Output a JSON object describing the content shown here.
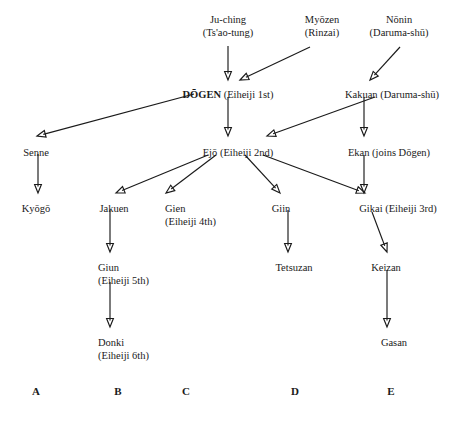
{
  "diagram": {
    "type": "lineage-tree",
    "title": "",
    "nodes": [
      {
        "id": "juching",
        "name": "Ju-ching",
        "detail": "(Ts'ao-tung)",
        "bold": false,
        "x": 228,
        "y": 14,
        "align": "center"
      },
      {
        "id": "myozen",
        "name": "Myōzen",
        "detail": "(Rinzai)",
        "bold": false,
        "x": 322,
        "y": 14,
        "align": "center"
      },
      {
        "id": "nonin",
        "name": "Nōnin",
        "detail": "(Daruma-shū)",
        "bold": false,
        "x": 399,
        "y": 14,
        "align": "center"
      },
      {
        "id": "dogen",
        "name": "DŌGEN",
        "detail": " (Eiheiji 1st)",
        "bold": true,
        "x": 228,
        "y": 89,
        "align": "center",
        "inline": true
      },
      {
        "id": "kakuan",
        "name": "Kakuan",
        "detail": " (Daruma-shū)",
        "bold": false,
        "x": 392,
        "y": 89,
        "align": "center",
        "inline": true
      },
      {
        "id": "senne",
        "name": "Senne",
        "detail": "",
        "bold": false,
        "x": 36,
        "y": 147,
        "align": "center"
      },
      {
        "id": "ejo",
        "name": "Ejō",
        "detail": " (Eiheiji 2nd)",
        "bold": false,
        "x": 238,
        "y": 147,
        "align": "center",
        "inline": true
      },
      {
        "id": "ekan",
        "name": "Ekan",
        "detail": " (joins Dōgen)",
        "bold": false,
        "x": 389,
        "y": 147,
        "align": "center",
        "inline": true
      },
      {
        "id": "kyogo",
        "name": "Kyōgō",
        "detail": "",
        "bold": false,
        "x": 36,
        "y": 203,
        "align": "center"
      },
      {
        "id": "jakuen",
        "name": "Jakuen",
        "detail": "",
        "bold": false,
        "x": 114,
        "y": 203,
        "align": "center"
      },
      {
        "id": "gien",
        "name": "Gien",
        "detail": "(Eiheiji 4th)",
        "bold": false,
        "x": 165,
        "y": 203,
        "align": "left"
      },
      {
        "id": "giin",
        "name": "Giin",
        "detail": "",
        "bold": false,
        "x": 281,
        "y": 203,
        "align": "center"
      },
      {
        "id": "gikai",
        "name": "Gikai",
        "detail": " (Eiheiji 3rd)",
        "bold": false,
        "x": 398,
        "y": 203,
        "align": "center",
        "inline": true
      },
      {
        "id": "giun",
        "name": "Giun",
        "detail": "(Eiheiji 5th)",
        "bold": false,
        "x": 98,
        "y": 262,
        "align": "left"
      },
      {
        "id": "tetsuzan",
        "name": "Tetsuzan",
        "detail": "",
        "bold": false,
        "x": 294,
        "y": 262,
        "align": "center"
      },
      {
        "id": "keizan",
        "name": "Keizan",
        "detail": "",
        "bold": false,
        "x": 386,
        "y": 262,
        "align": "center"
      },
      {
        "id": "donki",
        "name": "Donki",
        "detail": "(Eiheiji 6th)",
        "bold": false,
        "x": 98,
        "y": 337,
        "align": "left"
      },
      {
        "id": "gasan",
        "name": "Gasan",
        "detail": "",
        "bold": false,
        "x": 394,
        "y": 337,
        "align": "center"
      }
    ],
    "edges": [
      {
        "from": "juching",
        "to": "dogen",
        "x1": 228,
        "y1": 46,
        "x2": 228,
        "y2": 80
      },
      {
        "from": "myozen",
        "to": "dogen",
        "x1": 310,
        "y1": 47,
        "x2": 240,
        "y2": 80
      },
      {
        "from": "nonin",
        "to": "kakuan",
        "x1": 400,
        "y1": 47,
        "x2": 370,
        "y2": 80
      },
      {
        "from": "dogen",
        "to": "senne",
        "x1": 194,
        "y1": 94,
        "x2": 37,
        "y2": 136
      },
      {
        "from": "dogen",
        "to": "ejo",
        "x1": 228,
        "y1": 97,
        "x2": 228,
        "y2": 136
      },
      {
        "from": "kakuan",
        "to": "ejo",
        "x1": 375,
        "y1": 97,
        "x2": 267,
        "y2": 136
      },
      {
        "from": "kakuan",
        "to": "ekan",
        "x1": 364,
        "y1": 97,
        "x2": 364,
        "y2": 136
      },
      {
        "from": "senne",
        "to": "kyogo",
        "x1": 38,
        "y1": 154,
        "x2": 38,
        "y2": 193
      },
      {
        "from": "ejo",
        "to": "jakuen",
        "x1": 208,
        "y1": 155,
        "x2": 116,
        "y2": 193
      },
      {
        "from": "ejo",
        "to": "gien",
        "x1": 216,
        "y1": 155,
        "x2": 166,
        "y2": 193
      },
      {
        "from": "ejo",
        "to": "giin",
        "x1": 245,
        "y1": 155,
        "x2": 280,
        "y2": 193
      },
      {
        "from": "ejo",
        "to": "gikai",
        "x1": 263,
        "y1": 155,
        "x2": 365,
        "y2": 193
      },
      {
        "from": "ekan",
        "to": "gikai",
        "x1": 364,
        "y1": 155,
        "x2": 364,
        "y2": 193
      },
      {
        "from": "jakuen",
        "to": "giun",
        "x1": 110,
        "y1": 210,
        "x2": 110,
        "y2": 252
      },
      {
        "from": "giin",
        "to": "tetsuzan",
        "x1": 288,
        "y1": 210,
        "x2": 288,
        "y2": 252
      },
      {
        "from": "gikai",
        "to": "keizan",
        "x1": 372,
        "y1": 212,
        "x2": 387,
        "y2": 252
      },
      {
        "from": "giun",
        "to": "donki",
        "x1": 110,
        "y1": 282,
        "x2": 110,
        "y2": 327
      },
      {
        "from": "keizan",
        "to": "gasan",
        "x1": 387,
        "y1": 270,
        "x2": 387,
        "y2": 327
      }
    ],
    "column_labels": [
      {
        "label": "A",
        "x": 36,
        "y": 385
      },
      {
        "label": "B",
        "x": 118,
        "y": 385
      },
      {
        "label": "C",
        "x": 186,
        "y": 385
      },
      {
        "label": "D",
        "x": 295,
        "y": 385
      },
      {
        "label": "E",
        "x": 391,
        "y": 385
      }
    ]
  }
}
